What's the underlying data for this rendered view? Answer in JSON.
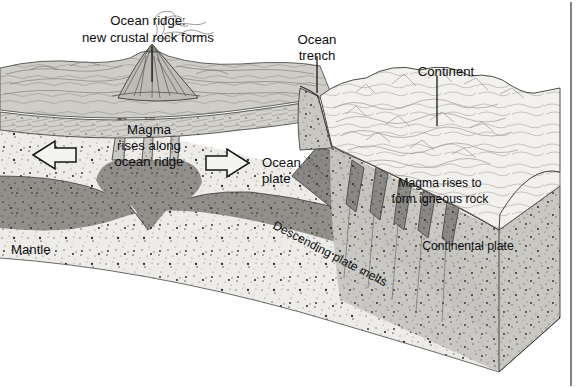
{
  "figure": {
    "type": "geologic-block-diagram"
  },
  "labels": {
    "ocean_ridge_line1": "Ocean ridge:",
    "ocean_ridge_line2": "new crustal rock forms",
    "ocean_trench_line1": "Ocean",
    "ocean_trench_line2": "trench",
    "continent": "Continent",
    "magma_ridge_line1": "Magma",
    "magma_ridge_line2": "rises along",
    "magma_ridge_line3": "ocean ridge",
    "ocean_plate_line1": "Ocean",
    "ocean_plate_line2": "plate",
    "mantle": "Mantle",
    "magma_igneous_line1": "Magma rises to",
    "magma_igneous_line2": "form igneous rock",
    "descending_plate": "Descending plate melts",
    "continental_plate": "Continental plate"
  },
  "arrows": {
    "left_spreading": "left-arrow-icon",
    "right_spreading": "right-arrow-icon"
  },
  "icons": {
    "volcano": "volcano-icon",
    "steam_plume": "steam-plume-icon",
    "mountains": "mountain-range-icon"
  },
  "colors": {
    "page_background": "#ffffff",
    "ink": "#0d0d0d",
    "crust_light": "#d7d6d2",
    "crust_mid": "#bfbdb8",
    "mantle_light": "#eceae6",
    "magma_dark": "#8d8b87",
    "slab_dark": "#8a8884",
    "seafloor": "#c9c7c2",
    "continent_white": "#f3f2ef",
    "arrow_fill": "#f4f4f2",
    "border": "#1a1a1a"
  }
}
